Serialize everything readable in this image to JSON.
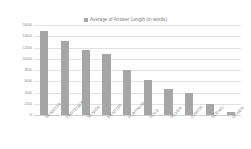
{
  "chart_data": {
    "type": "bar",
    "title": "",
    "legend": "Average of Answer Length (in words)",
    "legend_position": "top-center",
    "xlabel": "",
    "ylabel": "",
    "ylim": [
      0,
      1600
    ],
    "ytick_labels": [
      "1600",
      "1400",
      "1200",
      "1000",
      "800",
      "600",
      "400",
      "200",
      "0"
    ],
    "ytick_values": [
      1600,
      1400,
      1200,
      1000,
      800,
      600,
      400,
      200,
      0
    ],
    "grid": true,
    "categories": [
      "SENATOR",
      "PARTENER",
      "SENIOR",
      "MENTOR",
      "PLATINUM",
      "GOLD",
      "SILVER",
      "JUNIOR",
      "SCENIC",
      "OTHER"
    ],
    "values": [
      1500,
      1320,
      1160,
      1080,
      800,
      620,
      460,
      390,
      190,
      50
    ],
    "series": [
      {
        "name": "Average of Answer Length (in words)",
        "color": "#a6a6a6",
        "values": [
          1500,
          1320,
          1160,
          1080,
          800,
          620,
          460,
          390,
          190,
          50
        ]
      }
    ]
  },
  "style": {
    "bar_color": "#a6a6a6",
    "grid_color": "#e2e2e2",
    "text_color": "#8a8a8a",
    "background": "#ffffff"
  }
}
